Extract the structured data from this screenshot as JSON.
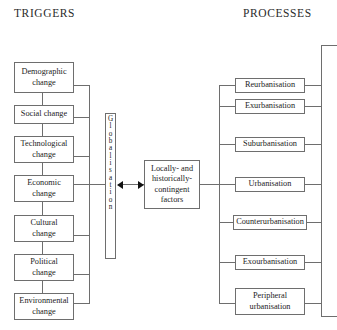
{
  "headers": {
    "triggers": "TRIGGERS",
    "processes": "PROCESSES"
  },
  "colors": {
    "background": "#ffffff",
    "box_border": "#6e6e6e",
    "connector": "#6e6e6e",
    "text": "#1c1c1c",
    "arrow": "#111111"
  },
  "triggers": {
    "items": [
      {
        "label": "Demographic change",
        "line1": "Demographic",
        "line2": "change"
      },
      {
        "label": "Social change",
        "line1": "Social change",
        "line2": ""
      },
      {
        "label": "Technological change",
        "line1": "Technological",
        "line2": "change"
      },
      {
        "label": "Economic change",
        "line1": "Economic",
        "line2": "change"
      },
      {
        "label": "Cultural change",
        "line1": "Cultural",
        "line2": "change"
      },
      {
        "label": "Political change",
        "line1": "Political",
        "line2": "change"
      },
      {
        "label": "Environmental change",
        "line1": "Environmental",
        "line2": "change"
      }
    ]
  },
  "globalisation": {
    "label": "Globalisation",
    "letters": [
      "G",
      "l",
      "o",
      "b",
      "a",
      "l",
      "i",
      "s",
      "a",
      "t",
      "i",
      "o",
      "n"
    ]
  },
  "center": {
    "label": "Locally- and historically-contingent factors",
    "line1": "Locally- and",
    "line2": "historically-",
    "line3": "contingent",
    "line4": "factors"
  },
  "processes": {
    "items": [
      {
        "label": "Reurbanisation",
        "line1": "Reurbanisation",
        "line2": ""
      },
      {
        "label": "Exurbanisation",
        "line1": "Exurbanisation",
        "line2": ""
      },
      {
        "label": "Suburbanisation",
        "line1": "Suburbanisation",
        "line2": ""
      },
      {
        "label": "Urbanisation",
        "line1": "Urbanisation",
        "line2": ""
      },
      {
        "label": "Counterurbanisation",
        "line1": "Counterurbanisation",
        "line2": ""
      },
      {
        "label": "Exourbanisation",
        "line1": "Exourbanisation",
        "line2": ""
      },
      {
        "label": "Peripheral urbanisation",
        "line1": "Peripheral",
        "line2": "urbanisation"
      }
    ]
  }
}
